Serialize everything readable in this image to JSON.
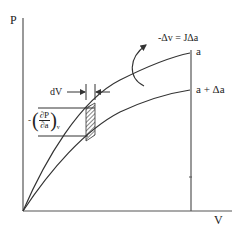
{
  "diagram": {
    "axes": {
      "y_label": "P",
      "x_label": "V"
    },
    "curves": [
      {
        "label": "a"
      },
      {
        "label": "a + Δa"
      }
    ],
    "annotations": {
      "increment_label": "dV",
      "equation": "-Δv = JΔa",
      "partial_minus": "-",
      "partial_num": "∂P",
      "partial_den": "∂a",
      "partial_sub": "v"
    },
    "colors": {
      "line": "#333333",
      "background": "#ffffff"
    }
  }
}
